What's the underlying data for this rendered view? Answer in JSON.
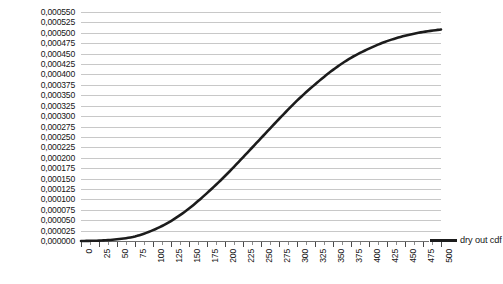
{
  "chart_data": {
    "type": "line",
    "title": "",
    "xlabel": "",
    "ylabel": "",
    "grid": true,
    "legend_position": "inside-bottom-right",
    "xlim": [
      0,
      500
    ],
    "ylim": [
      0.0,
      0.00055
    ],
    "x_tick_step": 25,
    "y_tick_step": 2.5e-05,
    "decimal_separator": ",",
    "x_tick_labels": [
      "0",
      "25",
      "50",
      "75",
      "100",
      "125",
      "150",
      "175",
      "200",
      "225",
      "250",
      "275",
      "300",
      "325",
      "350",
      "375",
      "400",
      "425",
      "450",
      "475",
      "500"
    ],
    "y_tick_labels": [
      "0,000550",
      "0,000525",
      "0,000500",
      "0,000475",
      "0,000450",
      "0,000425",
      "0,000400",
      "0,000375",
      "0,000350",
      "0,000325",
      "0,000300",
      "0,000275",
      "0,000250",
      "0,000225",
      "0,000200",
      "0,000175",
      "0,000150",
      "0,000125",
      "0,000100",
      "0,000075",
      "0,000050",
      "0,000025",
      "0,000000"
    ],
    "y_tick_values": [
      0.00055,
      0.000525,
      0.0005,
      0.000475,
      0.00045,
      0.000425,
      0.0004,
      0.000375,
      0.00035,
      0.000325,
      0.0003,
      0.000275,
      0.00025,
      0.000225,
      0.0002,
      0.000175,
      0.00015,
      0.000125,
      0.0001,
      7.5e-05,
      5e-05,
      2.5e-05,
      0.0
    ],
    "series": [
      {
        "name": "dry out cdf",
        "color": "#1c1c1c",
        "line_width": 2.6,
        "x": [
          0,
          25,
          50,
          75,
          100,
          125,
          150,
          175,
          200,
          225,
          250,
          275,
          300,
          325,
          350,
          375,
          400,
          425,
          450,
          475,
          500
        ],
        "values": [
          0.0,
          1e-06,
          4e-06,
          1.1e-05,
          2.6e-05,
          4.8e-05,
          7.8e-05,
          0.000115,
          0.000156,
          0.000201,
          0.000247,
          0.000293,
          0.000337,
          0.000376,
          0.000411,
          0.00044,
          0.000462,
          0.00048,
          0.000493,
          0.000502,
          0.000508
        ]
      }
    ]
  },
  "legend": {
    "entries": [
      {
        "label": "dry out cdf",
        "color": "#1c1c1c"
      }
    ]
  }
}
